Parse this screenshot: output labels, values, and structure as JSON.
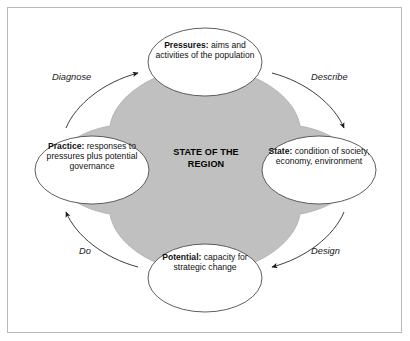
{
  "figure": {
    "center_label_line1": "STATE OF THE",
    "center_label_line2": "REGION",
    "colors": {
      "shape_fill": "#c0c0c0",
      "shape_stroke": "#9a9a9a",
      "ellipse_fill": "#ffffff",
      "ellipse_stroke": "#4d4d4d",
      "arrow": "#1a1a1a",
      "frame_border": "#b9b9b9",
      "background": "#ffffff",
      "text": "#111111"
    },
    "nodes": [
      {
        "id": "pressures",
        "position": "top",
        "lead": "Pressures:",
        "text": " aims and activities of the population"
      },
      {
        "id": "state",
        "position": "right",
        "lead": "State:",
        "text": " condition of society, economy, environment"
      },
      {
        "id": "potential",
        "position": "bottom",
        "lead": "Potential:",
        "text": " capacity for strategic change"
      },
      {
        "id": "practice",
        "position": "left",
        "lead": "Practice:",
        "text": " responses to pressures plus potential governance"
      }
    ],
    "process_labels": [
      {
        "id": "diagnose",
        "text": "Diagnose",
        "position": "top-left"
      },
      {
        "id": "describe",
        "text": "Describe",
        "position": "top-right"
      },
      {
        "id": "do",
        "text": "Do",
        "position": "bottom-left"
      },
      {
        "id": "design",
        "text": "Design",
        "position": "bottom-right"
      }
    ]
  }
}
